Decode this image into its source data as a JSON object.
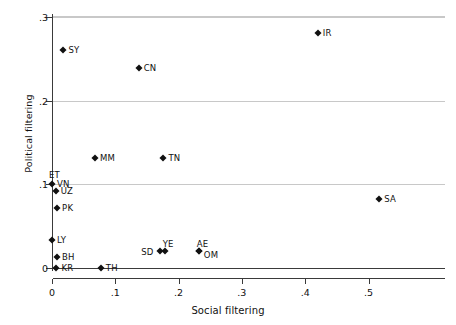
{
  "chart_data": {
    "type": "scatter",
    "title": "",
    "xlabel": "Social filtering",
    "ylabel": "Political filtering",
    "xlim": [
      -0.0175,
      0.5675
    ],
    "ylim": [
      0.0,
      0.3
    ],
    "xticks": [
      0,
      0.1,
      0.2,
      0.3,
      0.4,
      0.5
    ],
    "xticklabels": [
      "0",
      ".1",
      ".2",
      ".3",
      ".4",
      ".5"
    ],
    "yticks": [
      0,
      0.1,
      0.2,
      0.3
    ],
    "yticklabels": [
      "0",
      ".1",
      ".2",
      ".3"
    ],
    "grid": "horizontal",
    "legend": "none",
    "points": [
      {
        "label": "IR",
        "x": 0.42,
        "y": 0.281,
        "label_pos": "right"
      },
      {
        "label": "SY",
        "x": 0.018,
        "y": 0.26,
        "label_pos": "right"
      },
      {
        "label": "CN",
        "x": 0.137,
        "y": 0.239,
        "label_pos": "right"
      },
      {
        "label": "MM",
        "x": 0.068,
        "y": 0.131,
        "label_pos": "right"
      },
      {
        "label": "TN",
        "x": 0.176,
        "y": 0.131,
        "label_pos": "right"
      },
      {
        "label": "ET",
        "x": 0.0,
        "y": 0.1,
        "label_pos": "above-left"
      },
      {
        "label": "VN",
        "x": 0.0,
        "y": 0.1,
        "label_pos": "right"
      },
      {
        "label": "UZ",
        "x": 0.006,
        "y": 0.0925,
        "label_pos": "right"
      },
      {
        "label": "PK",
        "x": 0.008,
        "y": 0.0715,
        "label_pos": "right"
      },
      {
        "label": "SA",
        "x": 0.517,
        "y": 0.082,
        "label_pos": "right"
      },
      {
        "label": "LY",
        "x": 0.0,
        "y": 0.033,
        "label_pos": "right"
      },
      {
        "label": "YE",
        "x": 0.178,
        "y": 0.02,
        "label_pos": "above"
      },
      {
        "label": "AE",
        "x": 0.232,
        "y": 0.02,
        "label_pos": "above"
      },
      {
        "label": "SD",
        "x": 0.171,
        "y": 0.02,
        "label_pos": "left"
      },
      {
        "label": "OM",
        "x": 0.232,
        "y": 0.02,
        "label_pos": "right-below"
      },
      {
        "label": "BH",
        "x": 0.008,
        "y": 0.0135,
        "label_pos": "right"
      },
      {
        "label": "KR",
        "x": 0.007,
        "y": 0.0,
        "label_pos": "right"
      },
      {
        "label": "TH",
        "x": 0.077,
        "y": 0.0,
        "label_pos": "right"
      }
    ]
  },
  "colors": {
    "marker": "#111111",
    "axis": "#3a3a3a",
    "grid": "#c8c8c8",
    "background": "#ffffff"
  }
}
